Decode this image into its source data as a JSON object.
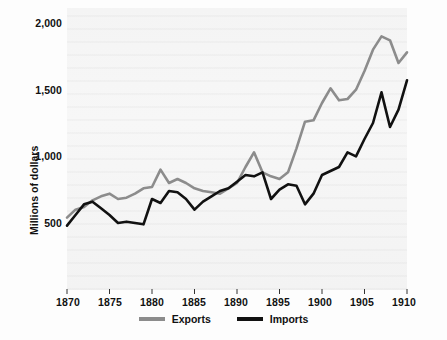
{
  "figure": {
    "background_color": "#fdfdfd",
    "plot_background_color": "#f5f5f5"
  },
  "axes": {
    "y_axis_title": "Millions of dollars",
    "y_tick_labels": [
      "2,000",
      "1,500",
      "1,000",
      "500"
    ],
    "y_tick_values": [
      2000,
      1500,
      1000,
      500
    ],
    "x_tick_labels": [
      "1870",
      "1875",
      "1880",
      "1885",
      "1890",
      "1895",
      "1900",
      "1905",
      "1910"
    ],
    "x_tick_values": [
      1870,
      1875,
      1880,
      1885,
      1890,
      1895,
      1900,
      1905,
      1910
    ]
  },
  "legend": {
    "position": "bottom-center",
    "entries": [
      {
        "label": "Exports",
        "color": "#8c8c8c"
      },
      {
        "label": "Imports",
        "color": "#111111"
      }
    ]
  },
  "chart_data": {
    "type": "line",
    "title": "",
    "subtitle": "",
    "xlabel": "",
    "ylabel": "Millions of dollars",
    "xlim": [
      1870,
      1910
    ],
    "ylim": [
      300,
      2050
    ],
    "grid": false,
    "legend_position": "bottom-center",
    "x": [
      1870,
      1871,
      1872,
      1873,
      1874,
      1875,
      1876,
      1877,
      1878,
      1879,
      1880,
      1881,
      1882,
      1883,
      1884,
      1885,
      1886,
      1887,
      1888,
      1889,
      1890,
      1891,
      1892,
      1893,
      1894,
      1895,
      1896,
      1897,
      1898,
      1899,
      1900,
      1901,
      1902,
      1903,
      1904,
      1905,
      1906,
      1907,
      1908,
      1909,
      1910
    ],
    "series": [
      {
        "name": "Exports",
        "color": "#8c8c8c",
        "values": [
          540,
          600,
          620,
          670,
          700,
          720,
          680,
          690,
          720,
          760,
          770,
          900,
          800,
          830,
          800,
          760,
          740,
          730,
          720,
          760,
          800,
          920,
          1030,
          880,
          850,
          830,
          880,
          1060,
          1260,
          1270,
          1400,
          1510,
          1420,
          1430,
          1500,
          1640,
          1800,
          1900,
          1870,
          1700,
          1780
        ]
      },
      {
        "name": "Imports",
        "color": "#111111",
        "values": [
          480,
          560,
          640,
          660,
          610,
          560,
          500,
          510,
          500,
          490,
          680,
          650,
          740,
          730,
          680,
          600,
          660,
          700,
          740,
          760,
          810,
          860,
          850,
          880,
          680,
          750,
          790,
          780,
          640,
          720,
          860,
          890,
          920,
          1030,
          1000,
          1130,
          1250,
          1480,
          1220,
          1350,
          1570
        ]
      }
    ]
  },
  "plot_geometry": {
    "left_px": 67,
    "right_px": 407,
    "top_px": 8,
    "bottom_px": 290,
    "y_pixel_2000": 23,
    "y_pixel_500": 223
  }
}
